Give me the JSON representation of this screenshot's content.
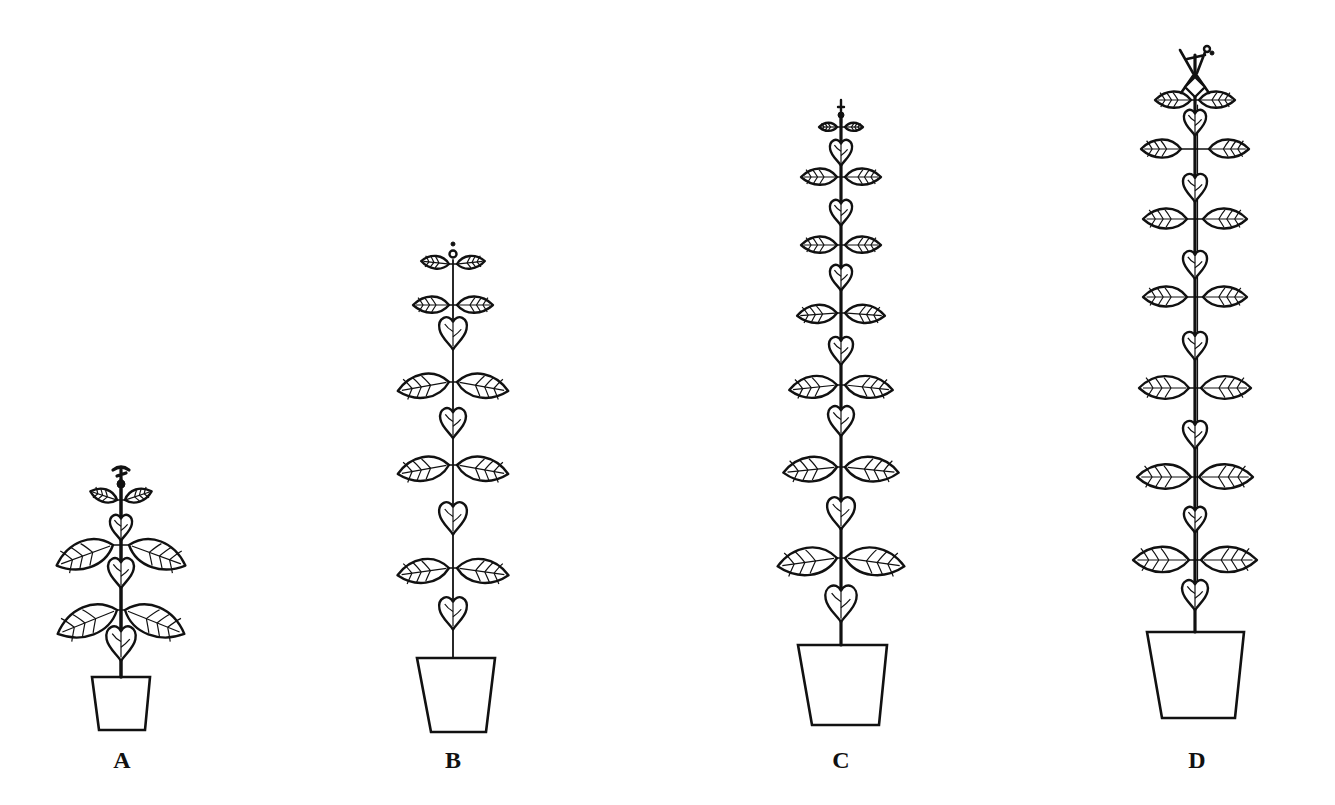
{
  "figure": {
    "background": "#ffffff",
    "ink_color": "#111111",
    "plants": [
      {
        "label": "A",
        "label_x": 122,
        "label_y": 748,
        "stem_x": 121,
        "stem_top": 470,
        "pot": {
          "top_y": 677,
          "bottom_y": 730,
          "top_left": 92,
          "top_right": 150,
          "bottom_left": 99,
          "bottom_right": 145
        },
        "nodes": [
          {
            "y": 500,
            "type": "pair",
            "span": 30,
            "size": 14,
            "tilt": -18
          },
          {
            "y": 525,
            "type": "heart",
            "size": 12
          },
          {
            "y": 545,
            "type": "pair",
            "span": 68,
            "size": 30,
            "tilt": 20
          },
          {
            "y": 570,
            "type": "heart",
            "size": 14
          },
          {
            "y": 610,
            "type": "pair",
            "span": 68,
            "size": 32,
            "tilt": 22
          },
          {
            "y": 640,
            "type": "heart",
            "size": 16
          }
        ],
        "top_type": "bud_cluster"
      },
      {
        "label": "B",
        "label_x": 453,
        "label_y": 748,
        "stem_x": 453,
        "stem_top": 250,
        "pot": {
          "top_y": 658,
          "bottom_y": 732,
          "top_left": 417,
          "top_right": 495,
          "bottom_left": 431,
          "bottom_right": 486
        },
        "nodes": [
          {
            "y": 264,
            "type": "pair",
            "span": 30,
            "size": 14,
            "tilt": -6
          },
          {
            "y": 305,
            "type": "pair",
            "span": 38,
            "size": 18,
            "tilt": 0
          },
          {
            "y": 330,
            "type": "heart",
            "size": 15
          },
          {
            "y": 382,
            "type": "pair",
            "span": 50,
            "size": 26,
            "tilt": 10
          },
          {
            "y": 420,
            "type": "heart",
            "size": 14
          },
          {
            "y": 465,
            "type": "pair",
            "span": 48,
            "size": 26,
            "tilt": 10
          },
          {
            "y": 515,
            "type": "heart",
            "size": 15
          },
          {
            "y": 568,
            "type": "pair",
            "span": 52,
            "size": 26,
            "tilt": 8
          },
          {
            "y": 610,
            "type": "heart",
            "size": 15
          }
        ],
        "top_type": "small_tip"
      },
      {
        "label": "C",
        "label_x": 841,
        "label_y": 748,
        "stem_x": 841,
        "stem_top": 105,
        "pot": {
          "top_y": 645,
          "bottom_y": 725,
          "top_left": 798,
          "top_right": 887,
          "bottom_left": 812,
          "bottom_right": 879
        },
        "nodes": [
          {
            "y": 127,
            "type": "pair",
            "span": 16,
            "size": 9,
            "tilt": 0
          },
          {
            "y": 150,
            "type": "heart",
            "size": 12
          },
          {
            "y": 177,
            "type": "pair",
            "span": 34,
            "size": 18,
            "tilt": 0
          },
          {
            "y": 210,
            "type": "heart",
            "size": 12
          },
          {
            "y": 245,
            "type": "pair",
            "span": 36,
            "size": 18,
            "tilt": 0
          },
          {
            "y": 275,
            "type": "heart",
            "size": 12
          },
          {
            "y": 313,
            "type": "pair",
            "span": 40,
            "size": 20,
            "tilt": 4
          },
          {
            "y": 348,
            "type": "heart",
            "size": 13
          },
          {
            "y": 385,
            "type": "pair",
            "span": 44,
            "size": 24,
            "tilt": 6
          },
          {
            "y": 418,
            "type": "heart",
            "size": 14
          },
          {
            "y": 467,
            "type": "pair",
            "span": 48,
            "size": 27,
            "tilt": 6
          },
          {
            "y": 510,
            "type": "heart",
            "size": 15
          },
          {
            "y": 558,
            "type": "pair",
            "span": 54,
            "size": 30,
            "tilt": 8
          },
          {
            "y": 600,
            "type": "heart",
            "size": 17
          }
        ],
        "top_type": "cross_tip"
      },
      {
        "label": "D",
        "label_x": 1197,
        "label_y": 748,
        "stem_x": 1195,
        "stem_top": 45,
        "pot": {
          "top_y": 632,
          "bottom_y": 718,
          "top_left": 1147,
          "top_right": 1244,
          "bottom_left": 1162,
          "bottom_right": 1235
        },
        "nodes": [
          {
            "y": 100,
            "type": "pair",
            "span": 26,
            "size": 18,
            "tilt": 0
          },
          {
            "y": 120,
            "type": "heart",
            "size": 12
          },
          {
            "y": 149,
            "type": "pair",
            "span": 54,
            "size": 20,
            "tilt": 0
          },
          {
            "y": 185,
            "type": "heart",
            "size": 13
          },
          {
            "y": 219,
            "type": "pair",
            "span": 52,
            "size": 22,
            "tilt": 0
          },
          {
            "y": 262,
            "type": "heart",
            "size": 13
          },
          {
            "y": 297,
            "type": "pair",
            "span": 52,
            "size": 22,
            "tilt": 0
          },
          {
            "y": 343,
            "type": "heart",
            "size": 13
          },
          {
            "y": 388,
            "type": "pair",
            "span": 56,
            "size": 25,
            "tilt": 0
          },
          {
            "y": 432,
            "type": "heart",
            "size": 13
          },
          {
            "y": 477,
            "type": "pair",
            "span": 58,
            "size": 27,
            "tilt": 0
          },
          {
            "y": 517,
            "type": "heart",
            "size": 12
          },
          {
            "y": 560,
            "type": "pair",
            "span": 62,
            "size": 28,
            "tilt": 0
          },
          {
            "y": 592,
            "type": "heart",
            "size": 14
          }
        ],
        "top_type": "flower_cluster"
      }
    ]
  }
}
